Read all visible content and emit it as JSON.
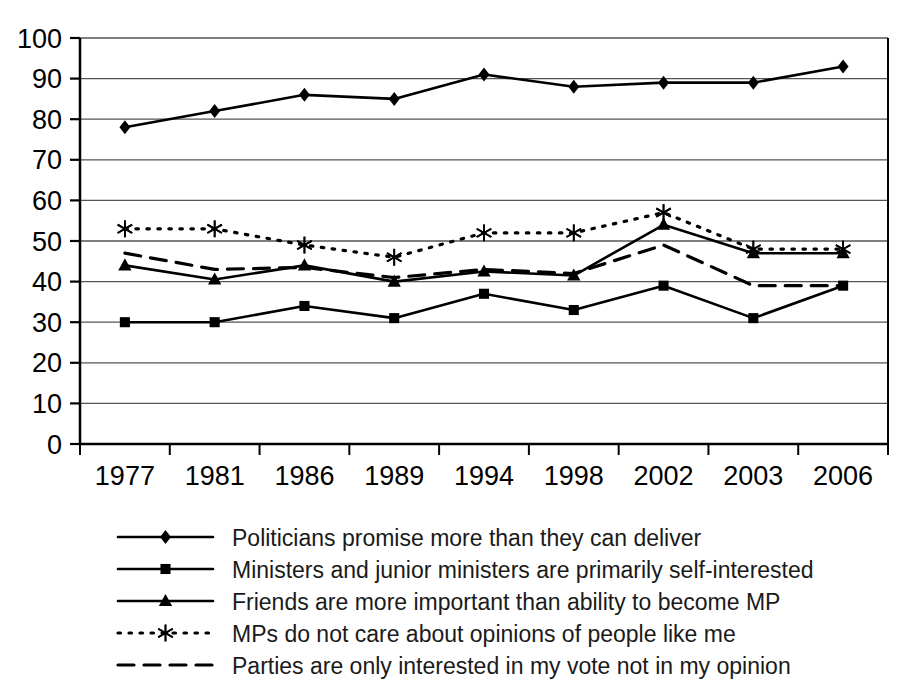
{
  "chart_data": {
    "type": "line",
    "title": "",
    "subtitle": "",
    "xlabel": "",
    "ylabel": "",
    "categories": [
      "1977",
      "1981",
      "1986",
      "1989",
      "1994",
      "1998",
      "2002",
      "2003",
      "2006"
    ],
    "ylim": [
      0,
      100
    ],
    "ytick_step": 10,
    "yticks": [
      "0",
      "10",
      "20",
      "30",
      "40",
      "50",
      "60",
      "70",
      "80",
      "90",
      "100"
    ],
    "grid": true,
    "grid_axis": "y",
    "legend_position": "bottom",
    "series": [
      {
        "name": "Politicians promise more than they can deliver",
        "marker": "diamond",
        "linestyle": "solid",
        "color": "#000000",
        "values": [
          78,
          82,
          86,
          85,
          91,
          88,
          89,
          89,
          93
        ]
      },
      {
        "name": "Ministers and junior ministers are primarily self-interested",
        "marker": "square",
        "linestyle": "solid",
        "color": "#000000",
        "values": [
          30,
          30,
          34,
          31,
          37,
          33,
          39,
          31,
          39
        ]
      },
      {
        "name": "Friends are more important than ability to become MP",
        "marker": "triangle",
        "linestyle": "solid",
        "color": "#000000",
        "values": [
          44,
          40.5,
          44,
          40,
          42.5,
          41.5,
          54,
          47,
          47
        ]
      },
      {
        "name": "MPs do not care about opinions of people like me",
        "marker": "asterisk",
        "linestyle": "dotted",
        "color": "#000000",
        "values": [
          53,
          53,
          49,
          46,
          52,
          52,
          57,
          48,
          48
        ]
      },
      {
        "name": "Parties are only interested in my vote not in my opinion",
        "marker": "none",
        "linestyle": "dashed",
        "color": "#000000",
        "values": [
          47,
          43,
          43.5,
          41,
          43,
          42,
          49,
          39,
          39
        ]
      }
    ]
  }
}
